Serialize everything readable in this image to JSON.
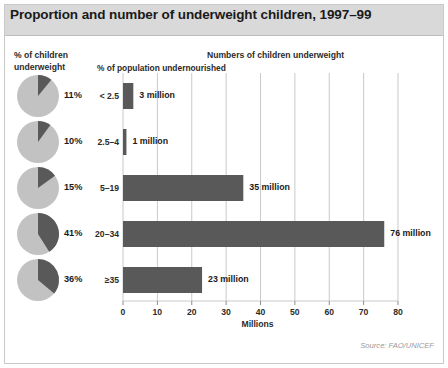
{
  "header": {
    "title": "Proportion and number of underweight children, 1997–99"
  },
  "labels": {
    "left_col_line1": "% of children",
    "left_col_line2": "underweight",
    "mid_col": "% of population undernourished",
    "right_col": "Numbers of children underweight",
    "source": "Source: FAO/UNICEF"
  },
  "colors": {
    "bar": "#595959",
    "pie_slice": "#595959",
    "pie_rest": "#c2c2c2",
    "grid": "#c9c9c9",
    "title_band": "#d9d9d9",
    "frame": "#c9c9c9"
  },
  "chart_data": {
    "type": "bar",
    "title": "Proportion and number of underweight children, 1997–99",
    "xlabel": "Millions",
    "ylabel": "% of population undernourished",
    "orientation": "horizontal",
    "xlim": [
      0,
      80
    ],
    "xticks": [
      0,
      10,
      20,
      30,
      40,
      50,
      60,
      70,
      80
    ],
    "xtick_labels": [
      "0",
      "10",
      "20",
      "30",
      "40",
      "50",
      "60",
      "70",
      "80"
    ],
    "grid": true,
    "legend": "none",
    "categories": [
      "< 2.5",
      "2.5–4",
      "5–19",
      "20–34",
      "≥35"
    ],
    "values": [
      3,
      1,
      35,
      76,
      23
    ],
    "value_labels": [
      "3 million",
      "1 million",
      "35 million",
      "76 million",
      "23 million"
    ],
    "secondary": {
      "name": "% of children underweight",
      "type": "pie",
      "values": [
        11,
        10,
        15,
        41,
        36
      ],
      "labels": [
        "11%",
        "10%",
        "15%",
        "41%",
        "36%"
      ]
    }
  }
}
